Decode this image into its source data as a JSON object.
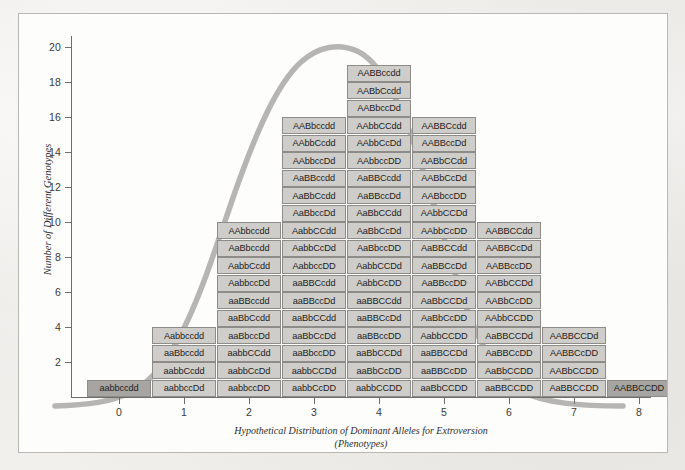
{
  "figure": {
    "y_axis_title": "Number of Different Genotypes",
    "x_axis_title_line1": "Hypothetical Distribution of Dominant Alleles for Extroversion",
    "x_axis_title_line2": "(Phenotypes)",
    "y_ticks": [
      "20",
      "18",
      "16",
      "14",
      "12",
      "10",
      "8",
      "6",
      "4",
      "2"
    ],
    "x_ticks": [
      "0",
      "1",
      "2",
      "3",
      "4",
      "5",
      "6",
      "7",
      "8"
    ],
    "cell_fill": "#cfcdc9",
    "cell_fill_dark": "#a7a5a1",
    "cell_border": "#8e8c88",
    "curve_color": "#b5b3af",
    "axis_color": "#6f6d6a"
  },
  "chart_data": {
    "type": "bar",
    "title": "Hypothetical Distribution of Dominant Alleles for Extroversion (Phenotypes)",
    "xlabel": "Hypothetical Distribution of Dominant Alleles for Extroversion (Phenotypes)",
    "ylabel": "Number of Different Genotypes",
    "categories": [
      "0",
      "1",
      "2",
      "3",
      "4",
      "5",
      "6",
      "7",
      "8"
    ],
    "values": [
      1,
      4,
      10,
      16,
      19,
      16,
      10,
      4,
      1
    ],
    "ylim": [
      0,
      21
    ],
    "grid": false,
    "legend": "none",
    "annotations": "Each stacked cell is labelled with a four-locus genotype; a smooth normal (bell) curve is overlaid on the histogram.",
    "columns": [
      {
        "x": "0",
        "count": 1,
        "genotypes": [
          "aabbccdd"
        ]
      },
      {
        "x": "1",
        "count": 4,
        "genotypes": [
          "aabbccDd",
          "aabbCcdd",
          "aaBbccdd",
          "Aabbccdd"
        ]
      },
      {
        "x": "2",
        "count": 10,
        "genotypes": [
          "aabbccDD",
          "aabbCcDd",
          "aabbCCdd",
          "aaBbccDd",
          "aaBbCcdd",
          "aaBBccdd",
          "AabbccDd",
          "AabbCcdd",
          "AaBbccdd",
          "AAbbccdd"
        ]
      },
      {
        "x": "3",
        "count": 16,
        "genotypes": [
          "aabbCcDD",
          "aabbCCDd",
          "aaBbccDD",
          "aaBbCcDd",
          "aaBbCCdd",
          "aaBBccDd",
          "aaBBCcdd",
          "AabbccDD",
          "AabbCcDd",
          "AabbCCdd",
          "AaBbccDd",
          "AaBbCcdd",
          "AaBBccdd",
          "AAbbccDd",
          "AAbbCcdd",
          "AABbccdd"
        ]
      },
      {
        "x": "4",
        "count": 19,
        "genotypes": [
          "aabbCCDD",
          "aaBbCcDD",
          "aaBbCCDd",
          "aaBBccDD",
          "aaBBCcDd",
          "aaBBCCdd",
          "AabbCcDD",
          "AabbCCDd",
          "AaBbccDD",
          "AaBbCcDd",
          "AaBbCCdd",
          "AaBBccDd",
          "AaBBCcdd",
          "AAbbccDD",
          "AAbbCcDd",
          "AAbbCCdd",
          "AABbccDd",
          "AABbCcdd",
          "AABBccdd"
        ]
      },
      {
        "x": "5",
        "count": 16,
        "genotypes": [
          "aaBbCCDD",
          "aaBBCcDD",
          "aaBBCCDd",
          "AabbCCDD",
          "AaBbCcDD",
          "AaBbCCDd",
          "AaBBccDD",
          "AaBBCcDd",
          "AaBBCCdd",
          "AAbbCcDD",
          "AAbbCCDd",
          "AABbccDD",
          "AABbCcDd",
          "AABbCCdd",
          "AABBccDd",
          "AABBCcdd"
        ]
      },
      {
        "x": "6",
        "count": 10,
        "genotypes": [
          "aaBBCCDD",
          "AaBbCCDD",
          "AaBBCcDD",
          "AaBBCCDd",
          "AAbbCCDD",
          "AABbCcDD",
          "AABbCCDd",
          "AABBccDD",
          "AABBCcDd",
          "AABBCCdd"
        ]
      },
      {
        "x": "7",
        "count": 4,
        "genotypes": [
          "AaBBCCDD",
          "AABbCCDD",
          "AABBCcDD",
          "AABBCCDd"
        ]
      },
      {
        "x": "8",
        "count": 1,
        "genotypes": [
          "AABBCCDD"
        ]
      }
    ]
  }
}
